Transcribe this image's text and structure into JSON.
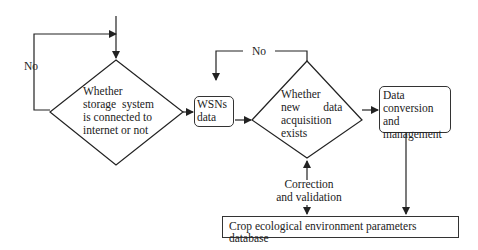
{
  "diagram": {
    "type": "flowchart",
    "nodes": {
      "decision_storage": {
        "shape": "diamond",
        "lines": [
          "Whether",
          "storage  system",
          "is connected to",
          "internet or not"
        ]
      },
      "wsn_data": {
        "shape": "rounded-rect",
        "lines": [
          "WSNs",
          "data"
        ]
      },
      "decision_new_data": {
        "shape": "diamond",
        "lines": [
          "Whether",
          "new        data",
          "acquisition",
          "exists"
        ]
      },
      "data_conversion": {
        "shape": "rounded-rect",
        "lines": [
          "Data",
          "conversion and",
          "management"
        ]
      },
      "database": {
        "shape": "rect",
        "label": "Crop ecological environment parameters database"
      }
    },
    "edge_labels": {
      "no_loop_left": "No",
      "no_loop_top": "No",
      "correction": [
        "Correction",
        "and validation"
      ]
    },
    "colors": {
      "line": "#222222",
      "background": "#ffffff"
    }
  }
}
